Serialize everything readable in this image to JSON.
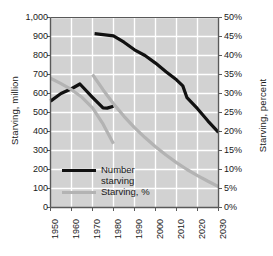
{
  "chart_data": {
    "type": "line",
    "title": "",
    "xlabel": "",
    "ylabel": "Starving, million",
    "y2label": "Starving, percent",
    "grid": true,
    "legend_position": "inside-lower-left",
    "xlim": [
      1950,
      2030
    ],
    "ylim": [
      0,
      1000
    ],
    "y2lim": [
      0,
      50
    ],
    "x_ticks": [
      "1950",
      "1960",
      "1970",
      "1980",
      "1990",
      "2000",
      "2010",
      "2020",
      "2030"
    ],
    "y_ticks": [
      "0",
      "100",
      "200",
      "300",
      "400",
      "500",
      "600",
      "700",
      "800",
      "900",
      "1,000"
    ],
    "y2_ticks": [
      "0%",
      "5%",
      "10%",
      "15%",
      "20%",
      "25%",
      "30%",
      "35%",
      "40%",
      "45%",
      "50%"
    ],
    "series": [
      {
        "name": "Number starving",
        "axis": "left",
        "color": "#111111",
        "width": 3.2,
        "segments": [
          {
            "note": "early historical segment 1950-1980",
            "x": [
              1950,
              1955,
              1960,
              1964,
              1970,
              1975,
              1977,
              1980
            ],
            "y": [
              560,
              600,
              625,
              650,
              580,
              524,
              523,
              533
            ]
          },
          {
            "note": "main projection segment 1971-2030",
            "x": [
              1971,
              1980,
              1985,
              1990,
              1995,
              2000,
              2005,
              2010,
              2013,
              2015,
              2020,
              2025,
              2030
            ],
            "y": [
              915,
              903,
              870,
              830,
              800,
              760,
              715,
              672,
              640,
              578,
              520,
              455,
              395
            ]
          }
        ]
      },
      {
        "name": "Starving, %",
        "axis": "right",
        "color": "#b3b3b3",
        "width": 3.2,
        "segments": [
          {
            "note": "early historical percent segment 1950-1980",
            "x": [
              1950,
              1955,
              1960,
              1965,
              1970,
              1975,
              1980
            ],
            "y": [
              34.0,
              32.6,
              31.0,
              29.0,
              26.2,
              22.0,
              16.8
            ]
          },
          {
            "note": "main projection percent segment 1970-2030",
            "x": [
              1970,
              1975,
              1980,
              1985,
              1990,
              1995,
              2000,
              2005,
              2010,
              2015,
              2020,
              2025,
              2030
            ],
            "y": [
              35.0,
              31.0,
              27.3,
              24.0,
              21.0,
              18.4,
              16.0,
              13.8,
              11.8,
              10.0,
              8.4,
              6.9,
              5.5
            ]
          }
        ]
      }
    ],
    "legend_entries": [
      {
        "label_line1": "Number",
        "label_line2": "starving",
        "color": "#111111"
      },
      {
        "label_line1": "Starving, %",
        "label_line2": "",
        "color": "#b3b3b3"
      }
    ],
    "style": {
      "plot_background": "#d2d2d2",
      "gridline_color": "#ffffff",
      "frame_color": "#595959",
      "page_background": "#ffffff"
    }
  }
}
